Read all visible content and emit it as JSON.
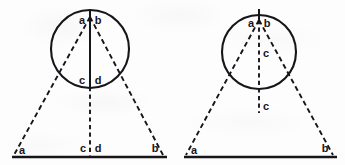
{
  "document": {
    "title": "Geometric construction diagrams",
    "background_color": "#fdfdfd",
    "ink_color": "#15151a",
    "figure_count": 2
  },
  "figures": [
    {
      "id": "figure-left",
      "name": "left-figure",
      "circle": {
        "cx": 90,
        "cy": 49,
        "r": 39
      },
      "apex": {
        "x": 90,
        "y": 17
      },
      "base_left": {
        "x": 14,
        "y": 155
      },
      "base_right": {
        "x": 163,
        "y": 155
      },
      "base_line": {
        "x1": 12,
        "y1": 157,
        "x2": 167,
        "y2": 157
      },
      "center_line": {
        "solid": {
          "x1": 90,
          "y1": 12,
          "x2": 90,
          "y2": 86
        },
        "dashed": {
          "x1": 90,
          "y1": 86,
          "x2": 90,
          "y2": 157
        }
      },
      "labels": {
        "apex_left": "a",
        "apex_right": "b",
        "circle_bottom_left": "c",
        "circle_bottom_right": "d",
        "base_left": "a",
        "base_center_left": "c",
        "base_center_right": "d",
        "base_right": "b"
      }
    },
    {
      "id": "figure-right",
      "name": "right-figure",
      "circle": {
        "cx": 259,
        "cy": 52,
        "r": 37
      },
      "apex": {
        "x": 259,
        "y": 20
      },
      "tick_top": {
        "x1": 259,
        "y1": 10,
        "x2": 259,
        "y2": 20
      },
      "base_left": {
        "x": 186,
        "y": 155
      },
      "base_right": {
        "x": 333,
        "y": 155
      },
      "base_line": {
        "x1": 184,
        "y1": 157,
        "x2": 337,
        "y2": 157
      },
      "center_line": {
        "dashed": {
          "x1": 259,
          "y1": 20,
          "x2": 259,
          "y2": 112
        }
      },
      "labels": {
        "apex_left": "a",
        "apex_right": "b",
        "inner_center": "c",
        "below_circle": "c",
        "base_left": "a",
        "base_right": "b"
      }
    }
  ]
}
